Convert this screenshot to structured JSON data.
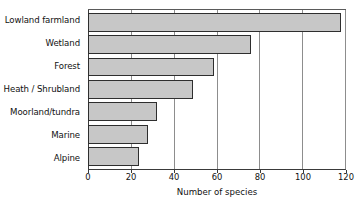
{
  "chart_data": {
    "type": "bar",
    "orientation": "horizontal",
    "title": "",
    "xlabel": "Number of species",
    "ylabel": "",
    "xlim": [
      0,
      120
    ],
    "ylim": null,
    "grid": true,
    "legend": null,
    "xticks": [
      0,
      20,
      40,
      60,
      80,
      100,
      120
    ],
    "xtick_labels": [
      "0",
      "20",
      "40",
      "60",
      "80",
      "100",
      "120"
    ],
    "categories": [
      "Lowland farmland",
      "Wetland",
      "Forest",
      "Heath / Shrubland",
      "Moorland/tundra",
      "Marine",
      "Alpine"
    ],
    "values": [
      118,
      76,
      59,
      49,
      32,
      28,
      24
    ],
    "bar_color": "#c7c7c7",
    "bar_edge_color": "#2e2e2e",
    "gridline_color": "#8d8d8d",
    "axis_color": "#3a3a3a"
  }
}
